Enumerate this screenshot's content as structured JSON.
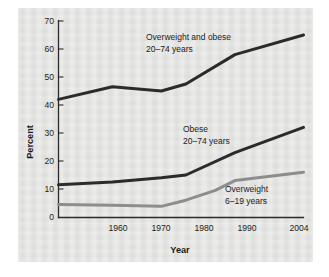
{
  "chart_data": {
    "type": "line",
    "title": "",
    "xlabel": "Year",
    "ylabel": "Percent",
    "xlim": [
      1954,
      2004
    ],
    "ylim": [
      0,
      70
    ],
    "grid": false,
    "legend_position": "inline-annotations",
    "x_ticks": [
      "1960",
      "1970",
      "1980",
      "1990",
      "2004"
    ],
    "x_tick_values": [
      1960,
      1970,
      1980,
      1990,
      2004
    ],
    "y_ticks": [
      "0",
      "10",
      "20",
      "30",
      "40",
      "50",
      "60",
      "70"
    ],
    "y_tick_values": [
      0,
      10,
      20,
      30,
      40,
      50,
      60,
      70
    ],
    "series": [
      {
        "name": "Overweight and obese 20-74 years",
        "color": "#2b2b2b",
        "x": [
          1954,
          1965,
          1975,
          1980,
          1990,
          2004
        ],
        "values": [
          42,
          46.5,
          45,
          47.5,
          58,
          65
        ]
      },
      {
        "name": "Obese 20-74 years",
        "color": "#2b2b2b",
        "x": [
          1954,
          1965,
          1975,
          1980,
          1990,
          2004
        ],
        "values": [
          11.5,
          12.5,
          14,
          15,
          23,
          32
        ]
      },
      {
        "name": "Overweight 6-19 years",
        "color": "#8d8d8d",
        "x": [
          1954,
          1965,
          1975,
          1980,
          1986,
          1990,
          2004
        ],
        "values": [
          4.5,
          4.2,
          3.8,
          6,
          9.5,
          13,
          16
        ]
      }
    ],
    "annotations": [
      {
        "line1": "Overweight and obese",
        "line2": "20–74 years"
      },
      {
        "line1": "Obese",
        "line2": "20–74 years"
      },
      {
        "line1": "Overweight",
        "line2": "6–19 years"
      }
    ]
  }
}
